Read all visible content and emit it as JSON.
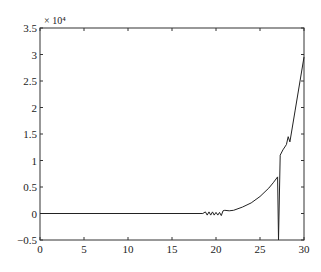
{
  "chart_data": {
    "type": "line",
    "title": "",
    "xlabel": "",
    "ylabel": "",
    "y_multiplier_label": "× 10⁴",
    "xlim": [
      0,
      30
    ],
    "ylim": [
      -0.5,
      3.5
    ],
    "grid": false,
    "legend": null,
    "xticks": [
      "0",
      "5",
      "10",
      "15",
      "20",
      "25",
      "30"
    ],
    "yticks": [
      "-0.5",
      "0",
      "0.5",
      "1",
      "1.5",
      "2",
      "2.5",
      "3",
      "3.5"
    ],
    "series": [
      {
        "name": "series1",
        "color": "#222222",
        "x": [
          0,
          5,
          10,
          15,
          18.5,
          18.8,
          19.0,
          19.2,
          19.4,
          19.6,
          19.8,
          20.0,
          20.2,
          20.4,
          20.6,
          20.8,
          21.0,
          21.5,
          22,
          23,
          24,
          25,
          26,
          26.5,
          27.0,
          27.1,
          27.3,
          27.6,
          28.0,
          28.2,
          28.4,
          29.0,
          30.0
        ],
        "values": [
          0,
          0,
          0,
          0,
          0,
          0.03,
          -0.03,
          0.03,
          -0.03,
          0.03,
          -0.03,
          0.02,
          -0.03,
          0.02,
          -0.04,
          0.05,
          0.06,
          0.05,
          0.06,
          0.12,
          0.2,
          0.32,
          0.48,
          0.58,
          0.69,
          -0.5,
          1.1,
          1.2,
          1.3,
          1.45,
          1.35,
          1.95,
          2.95
        ]
      }
    ]
  }
}
